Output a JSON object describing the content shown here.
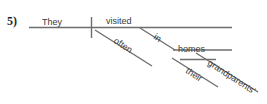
{
  "exercise": {
    "number_label": "5)"
  },
  "diagram": {
    "type": "reed-kellogg-sentence-diagram",
    "sentence": "They visited often in their grandparents' homes",
    "line_color": "#6e6e6e",
    "text_color": "#3a3a3a",
    "background": "#ffffff",
    "labels": {
      "subject": "They",
      "verb": "visited",
      "adverb": "often",
      "preposition": "in",
      "object_of_preposition": "homes",
      "determiner": "their",
      "possessive_modifier": "grandparents'"
    },
    "parts": [
      {
        "name": "subject",
        "text": "They",
        "line": "baseline-left"
      },
      {
        "name": "verb",
        "text": "visited",
        "line": "baseline-right"
      },
      {
        "name": "adverb",
        "text": "often",
        "line": "diagonal-under-verb"
      },
      {
        "name": "preposition",
        "text": "in",
        "line": "diagonal-under-verb"
      },
      {
        "name": "object-of-preposition",
        "text": "homes",
        "line": "horizontal-secondary"
      },
      {
        "name": "determiner",
        "text": "their",
        "line": "diagonal-under-homes"
      },
      {
        "name": "possessive-modifier",
        "text": "grandparents'",
        "line": "diagonal-under-homes"
      }
    ]
  }
}
